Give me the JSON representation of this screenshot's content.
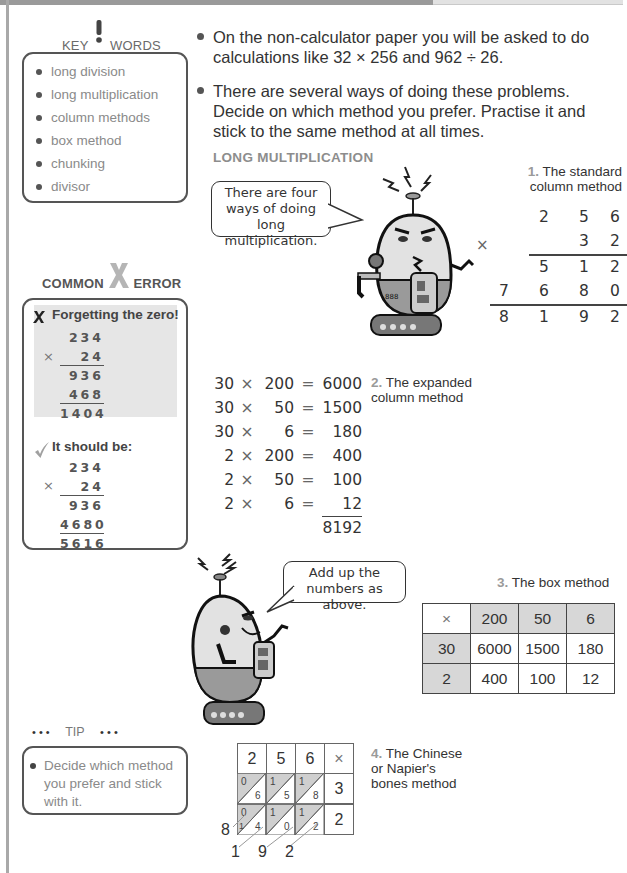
{
  "sidebar": {
    "key_words": {
      "title_left": "KEY",
      "title_icon": "exclamation-icon",
      "title_right": "WORDS",
      "items": [
        "long division",
        "long multiplication",
        "column methods",
        "box method",
        "chunking",
        "divisor"
      ]
    },
    "common_error": {
      "title_left": "COMMON",
      "title_icon": "big-x-icon",
      "title_right": "ERROR",
      "wrong_icon": "cross-icon",
      "wrong_heading": "Forgetting the zero!",
      "wrong_calc": {
        "top": "234",
        "sign": "×",
        "multiplier": "24",
        "partial1": "936",
        "partial2": "468",
        "total": "1404"
      },
      "right_icon": "check-icon",
      "right_heading": "It should be:",
      "right_calc": {
        "top": "234",
        "sign": "×",
        "multiplier": "24",
        "partial1": "936",
        "partial2": "4680",
        "total": "5616"
      }
    },
    "tip": {
      "dots": "• • •",
      "title": "TIP",
      "text": "Decide which method you prefer and stick with it."
    }
  },
  "main": {
    "bullets": [
      "On the non-calculator paper you will be asked to do calculations like 32 × 256 and 962 ÷ 26.",
      "There are several ways of doing these problems. Decide on which method you prefer. Practise it and stick to the same method at all times."
    ],
    "section_heading": "LONG MULTIPLICATION",
    "bubble1": "There are four ways of doing long multiplication.",
    "bubble2": "Add up the numbers as above.",
    "method1": {
      "num": "1.",
      "label": "The standard column method",
      "sign": "×",
      "rows": [
        [
          "",
          "2",
          "5",
          "6"
        ],
        [
          "",
          "",
          "3",
          "2"
        ],
        [
          "",
          "5",
          "1",
          "2"
        ],
        [
          "7",
          "6",
          "8",
          "0"
        ],
        [
          "8",
          "1",
          "9",
          "2"
        ]
      ]
    },
    "method2": {
      "num": "2.",
      "label": "The expanded column method",
      "rows": [
        [
          "30",
          "×",
          "200",
          "=",
          "6000"
        ],
        [
          "30",
          "×",
          "50",
          "=",
          "1500"
        ],
        [
          "30",
          "×",
          "6",
          "=",
          "180"
        ],
        [
          "2",
          "×",
          "200",
          "=",
          "400"
        ],
        [
          "2",
          "×",
          "50",
          "=",
          "100"
        ],
        [
          "2",
          "×",
          "6",
          "=",
          "12"
        ]
      ],
      "total": "8192"
    },
    "method3": {
      "num": "3.",
      "label": "The box method",
      "header": [
        "×",
        "200",
        "50",
        "6"
      ],
      "rows": [
        [
          "30",
          "6000",
          "1500",
          "180"
        ],
        [
          "2",
          "400",
          "100",
          "12"
        ]
      ]
    },
    "method4": {
      "num": "4.",
      "label": "The Chinese or Napier's bones method",
      "header": [
        "2",
        "5",
        "6",
        "×"
      ],
      "row1": {
        "cells": [
          [
            "0",
            "6"
          ],
          [
            "1",
            "5"
          ],
          [
            "1",
            "8"
          ]
        ],
        "mult": "3"
      },
      "row2": {
        "cells": [
          [
            "0",
            "4"
          ],
          [
            "1",
            "0"
          ],
          [
            "1",
            "2"
          ]
        ],
        "mult": "2",
        "carry": "1"
      },
      "results": [
        "8",
        "1",
        "9",
        "2"
      ]
    }
  }
}
